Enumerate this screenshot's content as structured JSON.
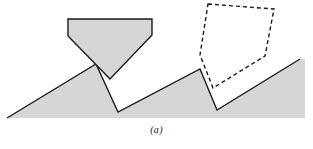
{
  "figure": {
    "caption": "(a)",
    "colors": {
      "surface_fill": "#d6d6d6",
      "stylus_fill": "#d6d6d6",
      "outline": "#1a1a1a",
      "dashed_outline": "#1a1a1a",
      "background": "#ffffff"
    },
    "geometry": {
      "surface_profile_points": "7,118 96,64 118,112 200,69 217,110 300,59 305,59 305,118",
      "solid_stylus_points": "68,19 152,19 152,35 110,79 68,36",
      "dashed_stylus_points": "208,4 274,9 265,56 213,88 200,55",
      "stroke_width": 1.4,
      "dash_pattern": "4,3"
    },
    "labels": {
      "solid_stylus": "stylus-solid",
      "dashed_stylus": "stylus-dashed",
      "surface": "rough-surface-profile"
    }
  }
}
